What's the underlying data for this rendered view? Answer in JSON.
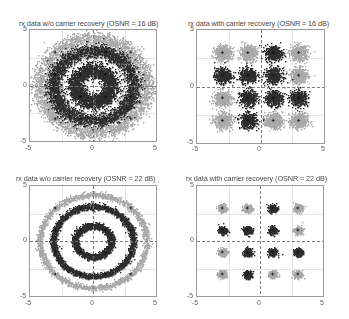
{
  "figure": {
    "colors": {
      "dark": "#2e2e2e",
      "light": "#a9a9a9",
      "axes_border": "#9a9a9a",
      "grid": "#bdbdbd"
    }
  },
  "chart_data": [
    {
      "type": "scatter",
      "title": "rx data w/o carrier recovery (OSNR = 16 dB)",
      "xlabel": "",
      "ylabel": "",
      "xlim": [
        -5,
        5
      ],
      "ylim": [
        -5,
        5
      ],
      "xticks": [
        "-5",
        "0",
        "5"
      ],
      "yticks": [
        "5",
        "0",
        "-5"
      ],
      "grid": true,
      "carrier_recovery": false,
      "osnr_db": 16,
      "description": "Phase-rotated 16-QAM: symbols smeared into concentric rings (radii ~1.4, ~3.2, ~4.2), heavy overlap",
      "rings": [
        1.41,
        3.16,
        4.24
      ],
      "noise_sigma": 0.55,
      "series": [
        {
          "name": "dark symbols",
          "color": "#2e2e2e"
        },
        {
          "name": "light symbols",
          "color": "#a9a9a9"
        }
      ]
    },
    {
      "type": "scatter",
      "title": "rx data with carrier recovery (OSNR = 16 dB)",
      "xlabel": "",
      "ylabel": "",
      "xlim": [
        -5,
        5
      ],
      "ylim": [
        -5,
        5
      ],
      "xticks": [
        "-5",
        "0",
        "5"
      ],
      "yticks": [
        "5",
        "0",
        "-5"
      ],
      "grid": true,
      "carrier_recovery": true,
      "osnr_db": 16,
      "description": "16-QAM constellation clusters at ±1, ±3",
      "noise_sigma": 0.45,
      "series": [
        {
          "name": "dark symbols",
          "color": "#2e2e2e",
          "points": [
            [
              1,
              3
            ],
            [
              -3,
              1
            ],
            [
              -1,
              1
            ],
            [
              1,
              1
            ],
            [
              -1,
              -1
            ],
            [
              1,
              -1
            ],
            [
              3,
              -1
            ],
            [
              -1,
              -3
            ]
          ]
        },
        {
          "name": "light symbols",
          "color": "#a9a9a9",
          "points": [
            [
              -3,
              3
            ],
            [
              -1,
              3
            ],
            [
              3,
              3
            ],
            [
              3,
              1
            ],
            [
              -3,
              -1
            ],
            [
              -3,
              -3
            ],
            [
              1,
              -3
            ],
            [
              3,
              -3
            ]
          ]
        }
      ]
    },
    {
      "type": "scatter",
      "title": "rx data w/o carrier recovery (OSNR = 22 dB)",
      "xlabel": "",
      "ylabel": "",
      "xlim": [
        -5,
        5
      ],
      "ylim": [
        -5,
        5
      ],
      "xticks": [
        "-5",
        "0",
        "5"
      ],
      "yticks": [
        "5",
        "0",
        "-5"
      ],
      "grid": true,
      "carrier_recovery": false,
      "osnr_db": 22,
      "description": "Phase-rotated 16-QAM: three clean concentric rings (radii ~1.4, ~3.2, ~4.2)",
      "rings": [
        1.41,
        3.16,
        4.24
      ],
      "noise_sigma": 0.22,
      "series": [
        {
          "name": "dark symbols",
          "color": "#2e2e2e"
        },
        {
          "name": "light symbols",
          "color": "#a9a9a9"
        }
      ]
    },
    {
      "type": "scatter",
      "title": "rx data with carrier recovery (OSNR = 22 dB)",
      "xlabel": "",
      "ylabel": "",
      "xlim": [
        -5,
        5
      ],
      "ylim": [
        -5,
        5
      ],
      "xticks": [
        "-5",
        "0",
        "5"
      ],
      "yticks": [
        "5",
        "0",
        "-5"
      ],
      "grid": true,
      "carrier_recovery": true,
      "osnr_db": 22,
      "description": "16-QAM constellation clusters at ±1, ±3 (tight)",
      "noise_sigma": 0.22,
      "series": [
        {
          "name": "dark symbols",
          "color": "#2e2e2e",
          "points": [
            [
              1,
              3
            ],
            [
              -3,
              1
            ],
            [
              -1,
              1
            ],
            [
              1,
              1
            ],
            [
              -1,
              -1
            ],
            [
              1,
              -1
            ],
            [
              3,
              -1
            ],
            [
              -1,
              -3
            ]
          ]
        },
        {
          "name": "light symbols",
          "color": "#a9a9a9",
          "points": [
            [
              -3,
              3
            ],
            [
              -1,
              3
            ],
            [
              3,
              3
            ],
            [
              3,
              1
            ],
            [
              -3,
              -1
            ],
            [
              -3,
              -3
            ],
            [
              1,
              -3
            ],
            [
              3,
              -3
            ]
          ]
        }
      ]
    }
  ],
  "panels": [
    {
      "title": "rx data w/o carrier recovery (OSNR = 16 dB)",
      "x_min": "-5",
      "x_mid": "0",
      "x_max": "5",
      "y_max": "5",
      "y_mid": "0",
      "y_min": "-5"
    },
    {
      "title": "rx data with carrier recovery (OSNR = 16 dB)",
      "x_min": "-5",
      "x_mid": "0",
      "x_max": "5",
      "y_max": "5",
      "y_mid": "0",
      "y_min": "-5"
    },
    {
      "title": "rx data w/o carrier recovery (OSNR = 22 dB)",
      "x_min": "-5",
      "x_mid": "0",
      "x_max": "5",
      "y_max": "5",
      "y_mid": "0",
      "y_min": "-5"
    },
    {
      "title": "rx data with carrier recovery (OSNR = 22 dB)",
      "x_min": "-5",
      "x_mid": "0",
      "x_max": "5",
      "y_max": "5",
      "y_mid": "0",
      "y_min": "-5"
    }
  ]
}
